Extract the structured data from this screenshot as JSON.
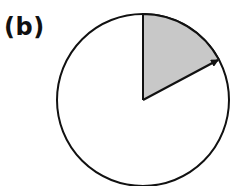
{
  "panel": {
    "label": "(b)"
  },
  "diagram": {
    "type": "circle-sector",
    "circle": {
      "cx": 143,
      "cy": 100,
      "r": 86,
      "stroke": "#111111",
      "fill": "#ffffff"
    },
    "sector": {
      "start_angle_deg_from_up_clockwise": 0,
      "end_angle_deg_from_up_clockwise": 62,
      "fill": "#c8c8c8"
    },
    "arrow": {
      "from": "center",
      "to": "circumference",
      "angle_deg_from_up_clockwise": 62,
      "color": "#111111"
    }
  }
}
